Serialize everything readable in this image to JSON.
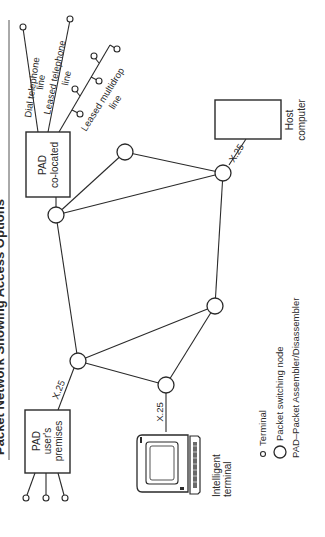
{
  "title": "Packet Network Showing Access Options",
  "orientation": "rotated 90 degrees counter-clockwise",
  "boxes": {
    "pad_colocated": {
      "line1": "PAD",
      "line2": "co-located"
    },
    "pad_user": {
      "line1": "PAD",
      "line2": "user's",
      "line3": "premises"
    },
    "host": {
      "line1": "Host",
      "line2": "computer"
    }
  },
  "line_labels": {
    "dial": {
      "line1": "Dial telephone",
      "line2": "line"
    },
    "leased": {
      "line1": "Leased telephone",
      "line2": "line"
    },
    "multidrop": {
      "line1": "Leased multidrop",
      "line2": "line"
    }
  },
  "protocol_labels": {
    "host_link": "X.25",
    "pad_user_link": "X.25",
    "terminal_link": "X.25"
  },
  "terminal": {
    "line1": "Intelligent",
    "line2": "terminal"
  },
  "legend": {
    "terminal": "Terminal",
    "node": "Packet switching node",
    "pad": "PAD–Packet Assembler/Disassembler"
  }
}
